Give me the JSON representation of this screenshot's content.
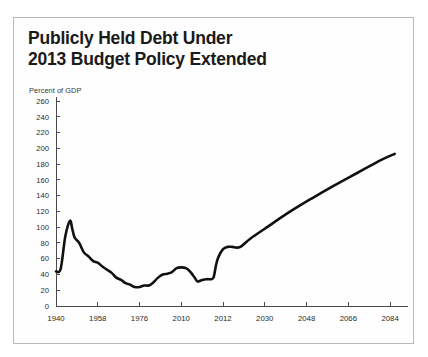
{
  "figure": {
    "title_line_1": "Publicly Held Debt Under",
    "title_line_2": "2013 Budget Policy Extended",
    "border_color": "#b9b9b9",
    "line_color": "#111111"
  },
  "chart_data": {
    "type": "line",
    "title": "Publicly Held Debt Under 2013 Budget Policy Extended",
    "xlabel": "",
    "ylabel": "Percent of GDP",
    "ylim": [
      0,
      260
    ],
    "xlim": [
      1940,
      2090
    ],
    "grid": false,
    "legend": null,
    "ytick_labels": [
      "0",
      "20",
      "40",
      "60",
      "80",
      "100",
      "120",
      "140",
      "160",
      "180",
      "200",
      "220",
      "240",
      "260"
    ],
    "ytick_values": [
      0,
      20,
      40,
      60,
      80,
      100,
      120,
      140,
      160,
      180,
      200,
      220,
      240,
      260
    ],
    "xtick_labels": [
      "1940",
      "1958",
      "1976",
      "2010",
      "2012",
      "2030",
      "2048",
      "2066",
      "2084"
    ],
    "xtick_values": [
      1940,
      1958,
      1976,
      1994,
      2012,
      2030,
      2048,
      2066,
      2084
    ],
    "series": [
      {
        "name": "Publicly Held Debt",
        "x": [
          1940,
          1942,
          1944,
          1946,
          1947,
          1948,
          1950,
          1952,
          1954,
          1956,
          1958,
          1960,
          1962,
          1964,
          1966,
          1968,
          1970,
          1972,
          1974,
          1976,
          1978,
          1980,
          1982,
          1984,
          1986,
          1988,
          1990,
          1992,
          1994,
          1996,
          1998,
          2000,
          2001,
          2003,
          2005,
          2007,
          2008,
          2009,
          2010,
          2012,
          2014,
          2016,
          2018,
          2020,
          2024,
          2030,
          2040,
          2050,
          2060,
          2070,
          2080,
          2086
        ],
        "y": [
          44,
          47,
          88,
          108,
          98,
          87,
          80,
          68,
          63,
          57,
          55,
          50,
          46,
          42,
          36,
          33,
          29,
          27,
          24,
          24,
          26,
          26,
          30,
          36,
          40,
          41,
          43,
          48,
          49,
          48,
          43,
          35,
          31,
          33,
          34,
          34,
          37,
          52,
          62,
          72,
          75,
          75,
          74,
          76,
          86,
          98,
          118,
          136,
          153,
          169,
          185,
          193
        ],
        "note": "Historical data through ~2012, then 2013 Budget Policy Extended projection rising to ~193 percent of GDP by 2086"
      }
    ]
  }
}
